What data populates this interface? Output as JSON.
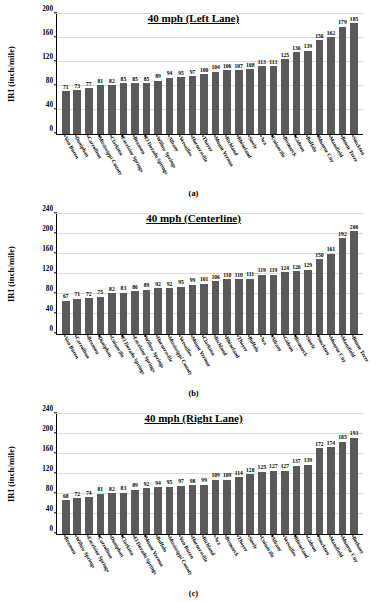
{
  "figure": {
    "ylabel": "IRI (inch/mile)",
    "bar_color": "#5a5a5a",
    "grid": true
  },
  "chart_data": [
    {
      "type": "bar",
      "panel": "a",
      "caption": "(a)",
      "title": "40 mph (Left Lane)",
      "xlabel": "",
      "ylabel": "IRI (inch/mile)",
      "ylim": [
        0,
        200
      ],
      "yticks": [
        0,
        40,
        80,
        120,
        160,
        200
      ],
      "grid": true,
      "legend": "none",
      "categories": [
        "Van Buren",
        "Doniphan",
        "Carrollton",
        "Mississippi County",
        "Clarkton",
        "Excelsior Springs",
        "Branson",
        "El Dorado Springs",
        "Willow Springs",
        "Albany",
        "Versailles",
        "Hornersville",
        "Thayer",
        "Mount Vernon",
        "Richland",
        "Rhineland",
        "Steele",
        "Ava",
        "Unionville",
        "Bismarck",
        "Gideon",
        "Buffalo",
        "Monroe City",
        "Mansfield",
        "Bonne Terre",
        "Stockton"
      ],
      "values": [
        71,
        73,
        77,
        81,
        82,
        85,
        85,
        85,
        89,
        94,
        95,
        97,
        100,
        104,
        106,
        107,
        108,
        113,
        113,
        125,
        136,
        139,
        156,
        162,
        179,
        185
      ]
    },
    {
      "type": "bar",
      "panel": "b",
      "caption": "(b)",
      "title": "40 mph (Centerline)",
      "xlabel": "",
      "ylabel": "IRI (inch/mile)",
      "ylim": [
        0,
        240
      ],
      "yticks": [
        0,
        40,
        80,
        120,
        160,
        200,
        240
      ],
      "grid": true,
      "legend": "none",
      "categories": [
        "Van Buren",
        "Carrollton",
        "Branson",
        "Doniphan",
        "Unionville",
        "El Dorado Springs",
        "Excelsior Springs",
        "Willow Springs",
        "Hornersville",
        "Mississippi County",
        "Versailles",
        "Mount Vernon",
        "Clarkton",
        "Richland",
        "Rhineland",
        "Thayer",
        "Buffalo",
        "Ava",
        "Albany",
        "Gideon",
        "Bismarck",
        "Steele",
        "Stockton",
        "Monroe City",
        "Mansfield",
        "Bonne Terre"
      ],
      "values": [
        67,
        71,
        72,
        75,
        82,
        83,
        86,
        89,
        92,
        92,
        95,
        99,
        101,
        106,
        110,
        110,
        111,
        119,
        119,
        124,
        126,
        129,
        150,
        161,
        192,
        206
      ]
    },
    {
      "type": "bar",
      "panel": "c",
      "caption": "(c)",
      "title": "40 mph (Right Lane)",
      "xlabel": "",
      "ylabel": "IRI (inch/mile)",
      "ylim": [
        0,
        240
      ],
      "yticks": [
        0,
        40,
        80,
        120,
        160,
        200,
        240
      ],
      "grid": true,
      "legend": "none",
      "categories": [
        "Branson",
        "Willow Springs",
        "Excelsior Springs",
        "Carrollton",
        "Doniphan",
        "Clarkton",
        "El Dorado Springs",
        "Mount Vernon",
        "Buffalo",
        "Mississippi County",
        "Van Buren",
        "Hornersville",
        "Richland",
        "Ava",
        "Bismarck",
        "Thayer",
        "Steele",
        "Unionville",
        "Albany",
        "Versailles",
        "Rhineland",
        "Gideon",
        "Stockton",
        "Mansfield",
        "Monroe City",
        "Bethany"
      ],
      "values": [
        68,
        72,
        74,
        81,
        82,
        83,
        89,
        92,
        94,
        95,
        97,
        98,
        99,
        109,
        109,
        114,
        120,
        125,
        127,
        127,
        137,
        139,
        172,
        174,
        185,
        193
      ]
    }
  ]
}
